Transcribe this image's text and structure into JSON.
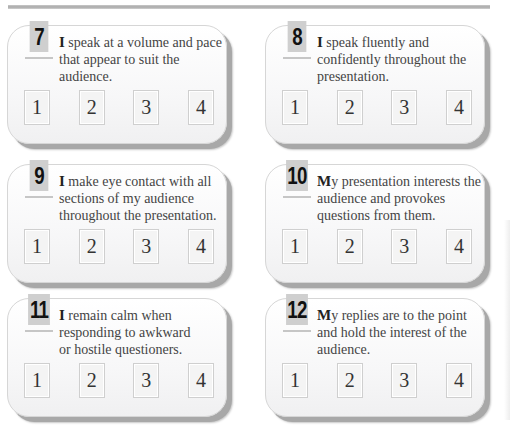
{
  "cards": [
    {
      "number": "7",
      "lead": "I",
      "text": " speak at a volume and pace that appear to suit the audience.",
      "ratings": [
        "1",
        "2",
        "3",
        "4"
      ]
    },
    {
      "number": "8",
      "lead": "I",
      "text": " speak fluently and confidently throughout the presentation.",
      "ratings": [
        "1",
        "2",
        "3",
        "4"
      ]
    },
    {
      "number": "9",
      "lead": "I",
      "text": " make eye contact with all sections of my audience throughout the presentation.",
      "ratings": [
        "1",
        "2",
        "3",
        "4"
      ]
    },
    {
      "number": "10",
      "lead": "M",
      "text": "y presentation interests the audience and provokes questions from them.",
      "ratings": [
        "1",
        "2",
        "3",
        "4"
      ]
    },
    {
      "number": "11",
      "lead": "I",
      "text": " remain calm when responding to awkward or hostile questioners.",
      "ratings": [
        "1",
        "2",
        "3",
        "4"
      ]
    },
    {
      "number": "12",
      "lead": "M",
      "text": "y replies are to the point and hold the interest of the audience.",
      "ratings": [
        "1",
        "2",
        "3",
        "4"
      ]
    }
  ]
}
